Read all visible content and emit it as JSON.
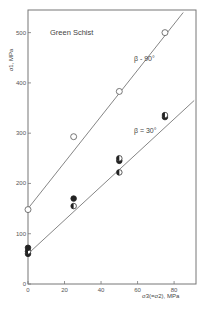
{
  "chart_data": {
    "type": "scatter",
    "title": "Green Schist",
    "xlabel": "σ3(=σ2), MPa",
    "ylabel": "σ1, MPa",
    "xlim": [
      0,
      92
    ],
    "ylim": [
      0,
      545
    ],
    "xticks": [
      0,
      20,
      40,
      60,
      80
    ],
    "yticks": [
      0,
      100,
      200,
      300,
      400,
      500
    ],
    "grid": false,
    "legend": "none",
    "series": [
      {
        "name": "β = 90°",
        "marker": "open-circle",
        "points": [
          [
            0,
            148
          ],
          [
            25,
            293
          ],
          [
            50,
            383
          ],
          [
            75,
            500
          ]
        ],
        "fit_line": [
          [
            0,
            150
          ],
          [
            85,
            540
          ]
        ]
      },
      {
        "name": "β = 30°",
        "marker": "filled/half-filled circle",
        "points": [
          [
            0,
            60
          ],
          [
            0,
            65
          ],
          [
            0,
            72
          ],
          [
            25,
            155
          ],
          [
            25,
            170
          ],
          [
            50,
            222
          ],
          [
            50,
            245
          ],
          [
            50,
            250
          ],
          [
            75,
            332
          ],
          [
            75,
            336
          ]
        ],
        "fit_line": [
          [
            0,
            60
          ],
          [
            91,
            365
          ]
        ]
      }
    ],
    "annotations": [
      {
        "text": "β - 90°",
        "x": 58,
        "y": 443
      },
      {
        "text": "β = 30°",
        "x": 58,
        "y": 300
      }
    ]
  }
}
